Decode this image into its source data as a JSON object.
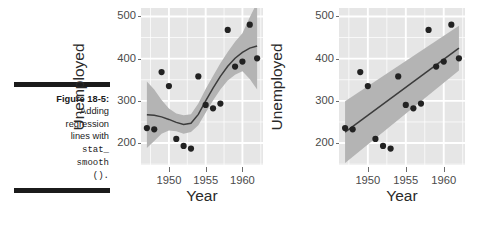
{
  "caption": {
    "figure_label": "Figure 18-5:",
    "line1": "Adding",
    "line2": "regression",
    "line3": "lines with",
    "code1": "stat_",
    "code2": "smooth",
    "code3": "()."
  },
  "colors": {
    "panel_background": "#e6e6e6",
    "gridline": "#ffffff",
    "point": "#222222",
    "fit_line": "#3c3c3c",
    "ribbon": "#b4b4b4",
    "axis_text": "#4a4a4a",
    "axis_title": "#2a2a2a",
    "rule": "#1b1b1b"
  },
  "chart_data": [
    {
      "type": "scatter",
      "title": "",
      "xlabel": "Year",
      "ylabel": "Unemployed",
      "xlim": [
        1946.2,
        1962.8
      ],
      "ylim": [
        148,
        520
      ],
      "xticks": [
        1950,
        1955,
        1960
      ],
      "yticks": [
        200,
        300,
        400,
        500
      ],
      "grid": true,
      "legend": "none",
      "smoother": "loess",
      "series": [
        {
          "name": "Unemployed",
          "x": [
            1947,
            1948,
            1949,
            1950,
            1951,
            1952,
            1953,
            1954,
            1955,
            1956,
            1957,
            1958,
            1959,
            1960,
            1961,
            1962
          ],
          "y": [
            235.6,
            232.5,
            368.2,
            335.1,
            209.9,
            193.2,
            187.0,
            357.8,
            290.4,
            282.2,
            293.6,
            468.1,
            381.3,
            393.1,
            480.6,
            400.7
          ]
        }
      ],
      "fit_line": {
        "method": "loess",
        "x": [
          1947,
          1948,
          1949,
          1950,
          1951,
          1952,
          1953,
          1954,
          1955,
          1956,
          1957,
          1958,
          1959,
          1960,
          1961,
          1962
        ],
        "y": [
          267,
          266,
          262,
          256,
          249,
          244,
          247,
          268,
          300,
          330,
          358,
          382,
          401,
          415,
          425,
          430
        ],
        "ymin": [
          188,
          205,
          222,
          230,
          228,
          222,
          226,
          242,
          272,
          301,
          327,
          348,
          362,
          370,
          352,
          327
        ],
        "ymax": [
          346,
          327,
          302,
          282,
          270,
          266,
          268,
          294,
          328,
          359,
          389,
          416,
          440,
          460,
          498,
          533
        ]
      }
    },
    {
      "type": "scatter",
      "title": "",
      "xlabel": "Year",
      "ylabel": "Unemployed",
      "xlim": [
        1946.2,
        1962.8
      ],
      "ylim": [
        148,
        520
      ],
      "xticks": [
        1950,
        1955,
        1960
      ],
      "yticks": [
        200,
        300,
        400,
        500
      ],
      "grid": true,
      "legend": "none",
      "smoother": "lm",
      "series": [
        {
          "name": "Unemployed",
          "x": [
            1947,
            1948,
            1949,
            1950,
            1951,
            1952,
            1953,
            1954,
            1955,
            1956,
            1957,
            1958,
            1959,
            1960,
            1961,
            1962
          ],
          "y": [
            235.6,
            232.5,
            368.2,
            335.1,
            209.9,
            193.2,
            187.0,
            357.8,
            290.4,
            282.2,
            293.6,
            468.1,
            381.3,
            393.1,
            480.6,
            400.7
          ]
        }
      ],
      "fit_line": {
        "method": "lm",
        "x": [
          1947,
          1962
        ],
        "y": [
          226,
          425
        ],
        "ymin": [
          153,
          372
        ],
        "ymax": [
          299,
          478
        ]
      }
    }
  ]
}
